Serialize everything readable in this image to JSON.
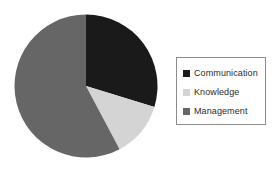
{
  "chart_data": {
    "type": "pie",
    "title": "",
    "subtitle": "",
    "categories": [
      "Communication",
      "Knowledge",
      "Management"
    ],
    "values": [
      29.7,
      12.5,
      57.8
    ],
    "unit": "percent",
    "colors": [
      "#1a1a1a",
      "#d4d4d4",
      "#666666"
    ],
    "start_angle_deg": 0,
    "direction": "clockwise",
    "slices": [
      {
        "label": "Communication",
        "value": 29.7,
        "color": "#1a1a1a",
        "start_angle_deg": 0,
        "end_angle_deg": 107
      },
      {
        "label": "Knowledge",
        "value": 12.5,
        "color": "#d4d4d4",
        "start_angle_deg": 107,
        "end_angle_deg": 152
      },
      {
        "label": "Management",
        "value": 57.8,
        "color": "#666666",
        "start_angle_deg": 152,
        "end_angle_deg": 360
      }
    ],
    "legend": {
      "position": "right",
      "border_color": "#8c8c8c",
      "entries": [
        {
          "label": "Communication",
          "color": "#1a1a1a"
        },
        {
          "label": "Knowledge",
          "color": "#d4d4d4"
        },
        {
          "label": "Management",
          "color": "#666666"
        }
      ]
    },
    "grid": false,
    "xlabel": "",
    "ylabel": ""
  },
  "legend": {
    "items": [
      {
        "label": "Communication"
      },
      {
        "label": "Knowledge"
      },
      {
        "label": "Management"
      }
    ]
  }
}
